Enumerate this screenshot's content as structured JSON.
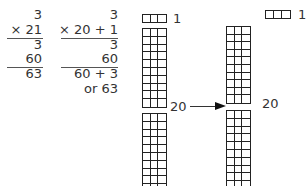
{
  "standard_algorithm": {
    "multiplicand": "3",
    "multiplier": "× 21",
    "partial_product_1": "3",
    "partial_product_2": "60",
    "result": "63"
  },
  "expanded_algorithm": {
    "multiplicand": "3",
    "multiplier": "× 20 + 1",
    "partial_product_1": "3",
    "partial_product_2": "60",
    "result": "60 + 3",
    "result_alt": "or 63"
  },
  "model_left": {
    "ones_label": "1",
    "tens_label": "20",
    "ones_strip_cells": 3,
    "tens_blocks": 2,
    "rows_per_block": 10
  },
  "model_right": {
    "ones_label": "1",
    "tens_label": "20",
    "ones_strip_cells": 3,
    "tens_blocks": 2,
    "rows_per_block": 10
  },
  "arrow_direction": "right",
  "colors": {
    "ink": "#222222",
    "text": "#333333",
    "background": "#ffffff"
  }
}
